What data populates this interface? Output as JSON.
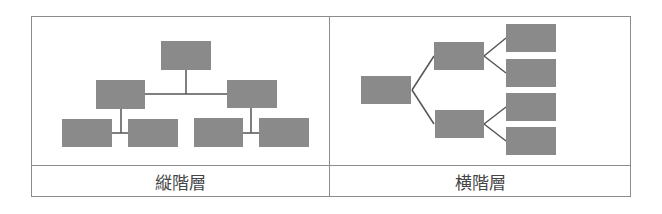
{
  "colors": {
    "box": "#8a8a8a",
    "line": "#555555",
    "border": "#8c8c8c",
    "text": "#444444"
  },
  "panels": [
    {
      "id": "vertical",
      "caption": "縦階層"
    },
    {
      "id": "horizontal",
      "caption": "横階層"
    }
  ]
}
